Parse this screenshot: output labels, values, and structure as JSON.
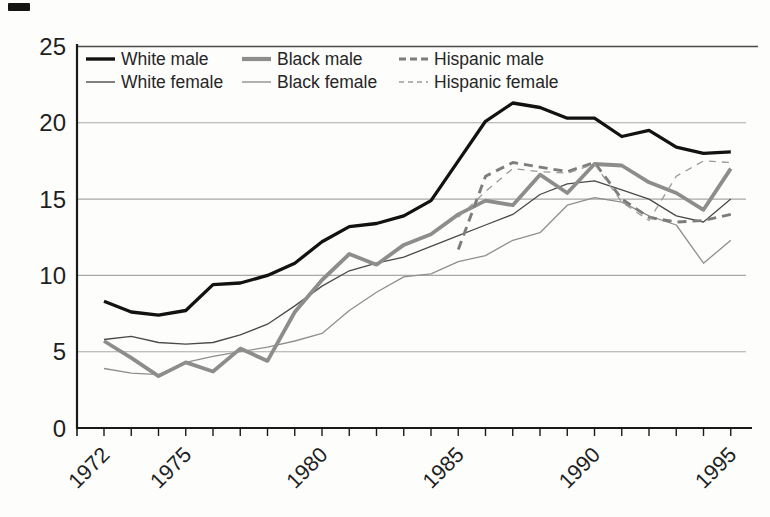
{
  "page": {
    "kind": "scanned book figure",
    "background": "#fdfdfb",
    "axis_color": "#1a1a1a",
    "grid_color": "#a8a8a8",
    "top_rule_color": "#4a4a4a"
  },
  "chart_data": {
    "type": "line",
    "title": "",
    "xlabel": "",
    "ylabel": "",
    "x_years": [
      1972,
      1973,
      1974,
      1975,
      1976,
      1977,
      1978,
      1979,
      1980,
      1981,
      1982,
      1983,
      1984,
      1985,
      1986,
      1987,
      1988,
      1989,
      1990,
      1991,
      1992,
      1993,
      1994,
      1995
    ],
    "x_ticks_labeled": [
      1972,
      1975,
      1980,
      1985,
      1990,
      1995
    ],
    "x_tick_every_year": true,
    "ylim": [
      0,
      25
    ],
    "y_ticks": [
      0,
      5,
      10,
      15,
      20,
      25
    ],
    "grid": "horizontal",
    "legend_position": "top-left-inside",
    "series": [
      {
        "name": "White male",
        "style": "solid",
        "weight": "thick",
        "color": "#121212",
        "start_year": 1972,
        "values": [
          8.3,
          7.6,
          7.4,
          7.7,
          9.4,
          9.5,
          10.0,
          10.8,
          12.2,
          13.2,
          13.4,
          13.9,
          14.9,
          17.5,
          20.1,
          21.3,
          21.0,
          20.3,
          20.3,
          19.1,
          19.5,
          18.4,
          18.0,
          18.1
        ]
      },
      {
        "name": "White female",
        "style": "solid",
        "weight": "thin",
        "color": "#4a4a4a",
        "start_year": 1972,
        "values": [
          5.8,
          6.0,
          5.6,
          5.5,
          5.6,
          6.1,
          6.8,
          8.0,
          9.3,
          10.3,
          10.8,
          11.2,
          11.9,
          12.6,
          13.3,
          14.0,
          15.3,
          16.0,
          16.2,
          15.6,
          15.0,
          13.9,
          13.5,
          15.0
        ]
      },
      {
        "name": "Black male",
        "style": "solid",
        "weight": "thick",
        "color": "#8d8d8d",
        "start_year": 1972,
        "values": [
          5.7,
          4.6,
          3.4,
          4.3,
          3.7,
          5.2,
          4.4,
          7.6,
          9.7,
          11.4,
          10.7,
          12.0,
          12.7,
          14.0,
          14.9,
          14.6,
          16.6,
          15.4,
          17.3,
          17.2,
          16.1,
          15.4,
          14.3,
          17.0
        ]
      },
      {
        "name": "Black female",
        "style": "solid",
        "weight": "thin",
        "color": "#8f8f8f",
        "start_year": 1972,
        "values": [
          3.9,
          3.6,
          3.5,
          4.3,
          4.7,
          5.0,
          5.3,
          5.7,
          6.2,
          7.7,
          8.9,
          9.9,
          10.1,
          10.9,
          11.3,
          12.3,
          12.8,
          14.6,
          15.1,
          14.8,
          13.9,
          13.3,
          10.8,
          12.3
        ]
      },
      {
        "name": "Hispanic male",
        "style": "dashed",
        "weight": "thick",
        "color": "#7d7d7d",
        "start_year": 1985,
        "values": [
          11.7,
          16.5,
          17.4,
          17.1,
          16.8,
          17.4,
          15.0,
          13.8,
          13.5,
          13.6,
          14.0
        ]
      },
      {
        "name": "Hispanic female",
        "style": "dashed",
        "weight": "thin",
        "color": "#9a9a9a",
        "start_year": 1985,
        "values": [
          13.8,
          15.5,
          17.0,
          16.8,
          16.7,
          17.3,
          14.8,
          13.6,
          16.5,
          17.5,
          17.4
        ]
      }
    ],
    "legend_rows": [
      [
        0,
        2,
        4
      ],
      [
        1,
        3,
        5
      ]
    ]
  }
}
